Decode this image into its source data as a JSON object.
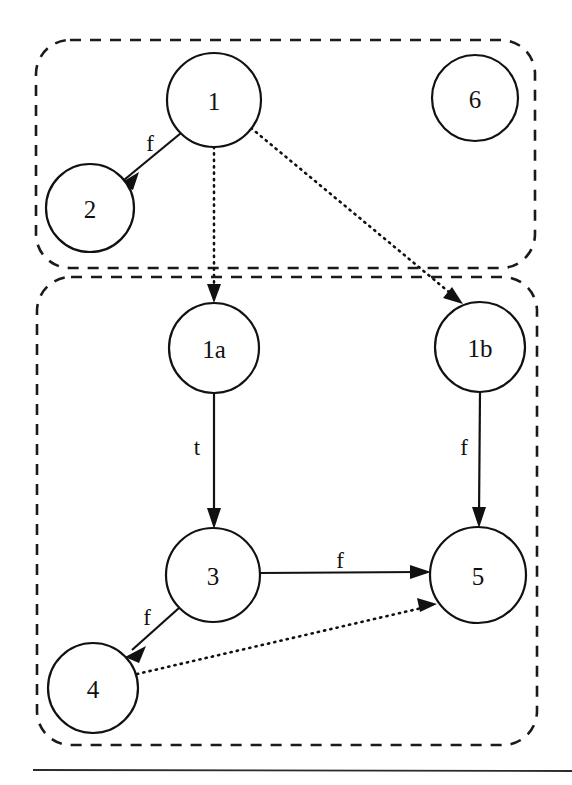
{
  "diagram": {
    "colors": {
      "stroke": "#111111",
      "group_stroke": "#1a1a1a",
      "node_fill": "#ffffff",
      "background": "#ffffff",
      "rule": "#2b2b2b"
    },
    "groups": [
      {
        "id": "group-top",
        "x": 36,
        "y": 40,
        "width": 499,
        "height": 228,
        "radius": 34,
        "style": "dashed"
      },
      {
        "id": "group-bottom",
        "x": 37,
        "y": 277,
        "width": 500,
        "height": 468,
        "radius": 34,
        "style": "dashed"
      }
    ],
    "nodes": [
      {
        "id": "1",
        "label": "1",
        "cx": 214,
        "cy": 100,
        "r": 47,
        "group": "group-top"
      },
      {
        "id": "2",
        "label": "2",
        "cx": 90,
        "cy": 208,
        "r": 44,
        "group": "group-top"
      },
      {
        "id": "6",
        "label": "6",
        "cx": 475,
        "cy": 98,
        "r": 43,
        "group": "group-top"
      },
      {
        "id": "1a",
        "label": "1a",
        "cx": 214,
        "cy": 348,
        "r": 45,
        "group": "group-bottom"
      },
      {
        "id": "1b",
        "label": "1b",
        "cx": 480,
        "cy": 347,
        "r": 45,
        "group": "group-bottom"
      },
      {
        "id": "3",
        "label": "3",
        "cx": 213,
        "cy": 575,
        "r": 47,
        "group": "group-bottom"
      },
      {
        "id": "5",
        "label": "5",
        "cx": 478,
        "cy": 575,
        "r": 48,
        "group": "group-bottom"
      },
      {
        "id": "4",
        "label": "4",
        "cx": 93,
        "cy": 688,
        "r": 45,
        "group": "group-bottom"
      }
    ],
    "edges": [
      {
        "id": "e-1-2",
        "from": "1",
        "to": "2",
        "label": "f",
        "style": "solid",
        "label_x": 150,
        "label_y": 143
      },
      {
        "id": "e-1-1a",
        "from": "1",
        "to": "1a",
        "label": "",
        "style": "dotted",
        "label_x": 0,
        "label_y": 0
      },
      {
        "id": "e-1-1b",
        "from": "1",
        "to": "1b",
        "label": "",
        "style": "dotted",
        "label_x": 0,
        "label_y": 0
      },
      {
        "id": "e-1a-3",
        "from": "1a",
        "to": "3",
        "label": "t",
        "style": "solid",
        "label_x": 197,
        "label_y": 447
      },
      {
        "id": "e-1b-5",
        "from": "1b",
        "to": "5",
        "label": "f",
        "style": "solid",
        "label_x": 464,
        "label_y": 447
      },
      {
        "id": "e-3-5",
        "from": "3",
        "to": "5",
        "label": "f",
        "style": "solid",
        "label_x": 340,
        "label_y": 560
      },
      {
        "id": "e-3-4",
        "from": "3",
        "to": "4",
        "label": "f",
        "style": "solid",
        "label_x": 147,
        "label_y": 617
      },
      {
        "id": "e-4-5",
        "from": "4",
        "to": "5",
        "label": "",
        "style": "dotted",
        "label_x": 0,
        "label_y": 0
      }
    ],
    "footer_rule": {
      "x1": 33,
      "y1": 770,
      "x2": 572,
      "y2": 771
    }
  }
}
